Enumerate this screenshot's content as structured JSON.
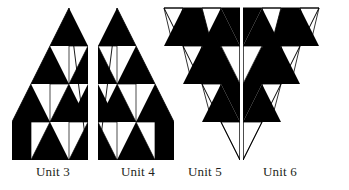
{
  "figure": {
    "background_color": "#ffffff",
    "fill_color": "#000000",
    "outline_color": "#000000",
    "unit_count": 4
  },
  "units": [
    {
      "id": "unit-3",
      "label": "Unit 3",
      "orientation": "apex-up-right-angle-right",
      "rows": 4,
      "description": "Right triangle, vertical edge on right, hypotenuse from top-right apex down to bottom-left",
      "filled_cells": 10,
      "empty_cells": 6
    },
    {
      "id": "unit-4",
      "label": "Unit 4",
      "orientation": "apex-up-right-angle-left",
      "rows": 4,
      "description": "Right triangle, vertical edge on left, hypotenuse from top-left apex down to bottom-right",
      "filled_cells": 10,
      "empty_cells": 6
    },
    {
      "id": "unit-5",
      "label": "Unit 5",
      "orientation": "apex-down-right-angle-right",
      "rows": 4,
      "description": "Inverted right triangle, horizontal top edge, vertical edge on right, hypotenuse from top-left down to bottom-right",
      "filled_cells": 7,
      "empty_cells": 9
    },
    {
      "id": "unit-6",
      "label": "Unit 6",
      "orientation": "apex-down-right-angle-left",
      "rows": 4,
      "description": "Inverted right triangle, horizontal top edge, vertical edge on left, hypotenuse from top-right down to bottom-left",
      "filled_cells": 7,
      "empty_cells": 9
    }
  ]
}
